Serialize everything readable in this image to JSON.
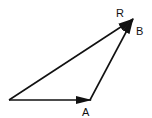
{
  "diagram": {
    "type": "vector-addition-triangle",
    "colors": {
      "stroke": "#111111",
      "background": "#ffffff"
    },
    "points": {
      "origin": [
        9,
        100
      ],
      "a_tip": [
        91,
        100
      ],
      "b_tip": [
        133,
        19
      ]
    },
    "vectors": [
      {
        "id": "A",
        "label": "A",
        "from": "origin",
        "to": "a_tip"
      },
      {
        "id": "B",
        "label": "B",
        "from": "a_tip",
        "to": "b_tip"
      },
      {
        "id": "R",
        "label": "R",
        "from": "origin",
        "to": "b_tip"
      }
    ],
    "labels": {
      "a": "A",
      "b": "B",
      "r": "R"
    }
  }
}
